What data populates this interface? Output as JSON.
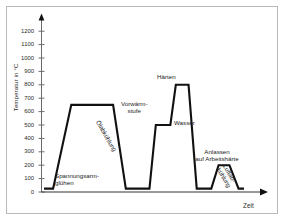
{
  "chart_data": {
    "type": "line",
    "title": "",
    "xlabel": "Zeit",
    "ylabel": "Temperatur in °C",
    "ylim": [
      0,
      1250
    ],
    "yticks": [
      0,
      100,
      200,
      300,
      400,
      500,
      600,
      700,
      800,
      900,
      1000,
      1100,
      1200
    ],
    "ytick_labels": [
      "0",
      "100",
      "200",
      "300",
      "400",
      "500",
      "600",
      "700",
      "800",
      "900",
      "1000",
      "1100",
      "1200"
    ],
    "grid": false,
    "legend": null,
    "x_axis_has_arrow": true,
    "y_axis_has_arrow": true,
    "x_tick_labels": [],
    "series": [
      {
        "name": "Wärmebehandlungsverlauf",
        "color": "#111111",
        "x": [
          0,
          1,
          3,
          5.6,
          7.6,
          9.0,
          10.0,
          11.6,
          12.3,
          13.9,
          14.5,
          15.9,
          16.8,
          17.4,
          18.4,
          19.2,
          20.4,
          21.4,
          22.0
        ],
        "y": [
          25,
          25,
          650,
          650,
          650,
          25,
          25,
          25,
          500,
          500,
          800,
          800,
          25,
          25,
          25,
          200,
          200,
          25,
          25
        ]
      }
    ],
    "annotations": [
      {
        "id": "spannungsarmgluehen",
        "text": "Spannungsarm-\nglühen",
        "lines": [
          "Spannungsarm-",
          "glühen"
        ],
        "rotation": 0
      },
      {
        "id": "oelabkuehlung",
        "text": "Ölabkühlung",
        "lines": [
          "Ölabkühlung"
        ],
        "rotation": -60
      },
      {
        "id": "vorwaermstufe",
        "text": "Vorwärm-\nstufe",
        "lines": [
          "Vorwärm-",
          "stufe"
        ],
        "rotation": 0
      },
      {
        "id": "haerten",
        "text": "Härten",
        "lines": [
          "Härten"
        ],
        "rotation": 0
      },
      {
        "id": "wasser",
        "text": "Wasser",
        "lines": [
          "Wasser"
        ],
        "rotation": 0
      },
      {
        "id": "anlassen",
        "text": "Anlassen\nauf Arbeitshärte",
        "lines": [
          "Anlassen",
          "auf Arbeitshärte"
        ],
        "rotation": 0
      },
      {
        "id": "luftabkuehlung",
        "text": "Luftab-\nkühlung",
        "lines": [
          "Luftab-",
          "kühlung"
        ],
        "rotation": -60
      }
    ]
  },
  "figure": {
    "border_color": "#b9b9b9",
    "background": "#ffffff",
    "curve_color": "#111111",
    "axis_color": "#6b6b6b",
    "text_color": "#1c1c1c"
  },
  "ticks": {
    "t0": "0",
    "t100": "100",
    "t200": "200",
    "t300": "300",
    "t400": "400",
    "t500": "500",
    "t600": "600",
    "t700": "700",
    "t800": "800",
    "t900": "900",
    "t1000": "1000",
    "t1100": "1100",
    "t1200": "1200"
  },
  "labels": {
    "y_axis_title": "Temperatur in °C",
    "x_axis_title": "Zeit",
    "spannungsarm_l1": "Spannungsarm-",
    "spannungsarm_l2": "glühen",
    "oelabkuehlung": "Ölabkühlung",
    "vorwaerm_l1": "Vorwärm-",
    "vorwaerm_l2": "stufe",
    "haerten": "Härten",
    "wasser": "Wasser",
    "anlassen_l1": "Anlassen",
    "anlassen_l2": "auf Arbeitshärte",
    "luftab_l1": "Luftab-",
    "luftab_l2": "kühlung"
  }
}
